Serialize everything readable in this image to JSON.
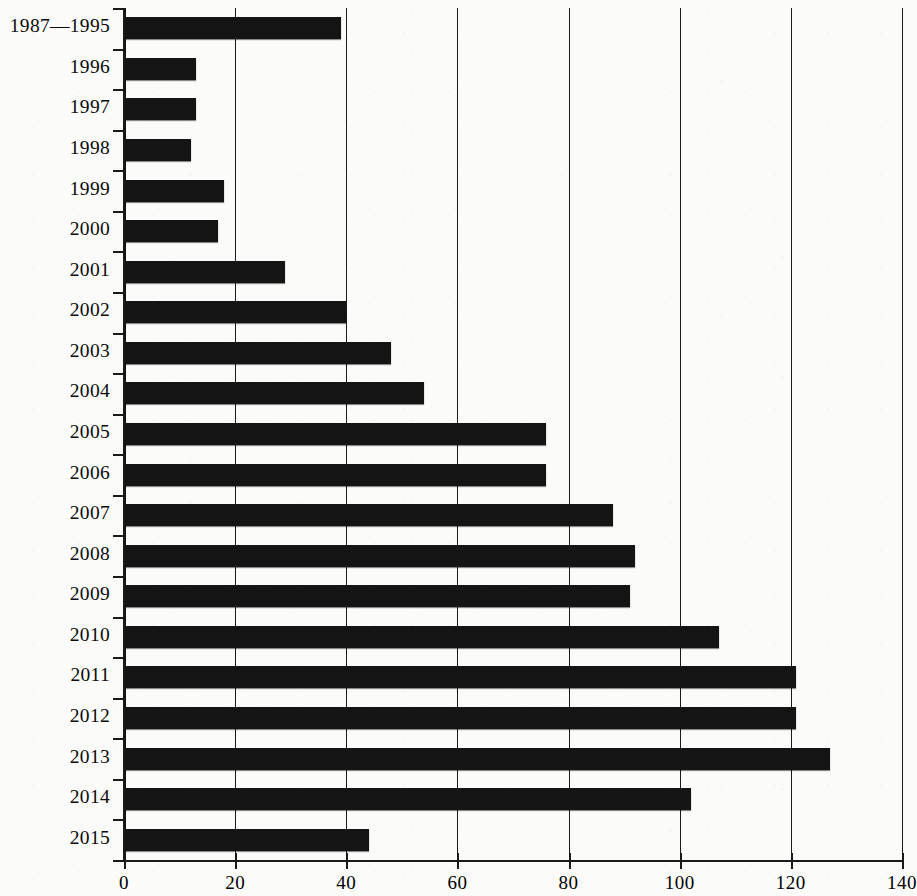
{
  "chart_data": {
    "type": "bar",
    "orientation": "horizontal",
    "title": "",
    "xlabel": "",
    "ylabel": "",
    "xlim": [
      0,
      140
    ],
    "xticks": [
      0,
      20,
      40,
      60,
      80,
      100,
      120,
      140
    ],
    "xtick_labels": [
      "0",
      "20",
      "40",
      "60",
      "80",
      "100",
      "120",
      "140"
    ],
    "grid": "vertical",
    "legend": "none",
    "bar_color": "#141414",
    "categories": [
      "1987—1995",
      "1996",
      "1997",
      "1998",
      "1999",
      "2000",
      "2001",
      "2002",
      "2003",
      "2004",
      "2005",
      "2006",
      "2007",
      "2008",
      "2009",
      "2010",
      "2011",
      "2012",
      "2013",
      "2014",
      "2015"
    ],
    "values": [
      39,
      13,
      13,
      12,
      18,
      17,
      29,
      40,
      48,
      54,
      76,
      76,
      88,
      92,
      91,
      107,
      121,
      121,
      127,
      102,
      44
    ]
  }
}
